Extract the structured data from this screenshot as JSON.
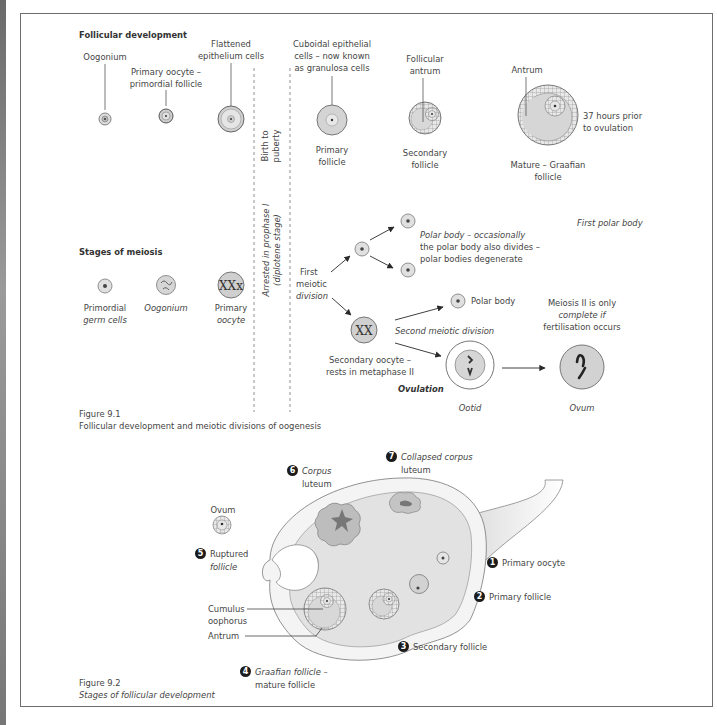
{
  "figure_9_1": {
    "caption_number": "Figure 9.1",
    "caption_text": "Follicular development and meiotic divisions of oogenesis",
    "follicular_development": {
      "heading": "Follicular development",
      "labels": {
        "oogonium": "Oogonium",
        "primary_oocyte_line1": "Primary oocyte –",
        "primary_oocyte_line2": "primordial follicle",
        "flattened_line1": "Flattened",
        "flattened_line2": "epithelium cells",
        "cuboidal_line1": "Cuboidal epithelial",
        "cuboidal_line2": "cells – now known",
        "cuboidal_line3": "as granulosa cells",
        "primary_follicle_line1": "Primary",
        "primary_follicle_line2": "follicle",
        "follicular_antrum_line1": "Follicular",
        "follicular_antrum_line2": "antrum",
        "secondary_follicle_line1": "Secondary",
        "secondary_follicle_line2": "follicle",
        "antrum": "Antrum",
        "graafian_line1": "Mature – Graafian",
        "graafian_line2": "follicle",
        "hours_line1": "37 hours prior",
        "hours_line2": "to ovulation"
      }
    },
    "dividers": {
      "birth_line1": "Birth to",
      "birth_line2": "puberty",
      "arrested_line1": "Arrested in prophase I",
      "arrested_line2": "(diplotene stage)"
    },
    "stages_of_meiosis": {
      "heading": "Stages of meiosis",
      "labels": {
        "primordial_line1": "Primordial",
        "primordial_line2": "germ cells",
        "oogonium": "Oogonium",
        "primary_oocyte_line1": "Primary",
        "primary_oocyte_line2": "oocyte",
        "first_meiotic_line1": "First",
        "first_meiotic_line2": "meiotic",
        "first_meiotic_line3": "division",
        "polar_body_note_line1": "Polar body – occasionally",
        "polar_body_note_line2": "the polar body also divides –",
        "polar_body_note_line3": "polar bodies degenerate",
        "first_polar_body": "First polar body",
        "polar_body": "Polar body",
        "second_meiotic": "Second meiotic division",
        "secondary_oocyte_line1": "Secondary oocyte –",
        "secondary_oocyte_line2": "rests in metaphase II",
        "ovulation": "Ovulation",
        "ootid": "Ootid",
        "meiosis2_line1": "Meiosis II is only",
        "meiosis2_line2": "complete if",
        "meiosis2_line3": "fertilisation occurs",
        "ovum": "Ovum"
      }
    }
  },
  "figure_9_2": {
    "caption_number": "Figure 9.2",
    "caption_text": "Stages of follicular development",
    "stages": [
      {
        "number": "1",
        "label_line1": "Primary oocyte",
        "label_line2": ""
      },
      {
        "number": "2",
        "label_line1": "Primary follicle",
        "label_line2": ""
      },
      {
        "number": "3",
        "label_line1": "Secondary follicle",
        "label_line2": ""
      },
      {
        "number": "4",
        "label_line1": "Graafian follicle –",
        "label_line2": "mature follicle"
      },
      {
        "number": "5",
        "label_line1": "Ruptured",
        "label_line2": "follicle"
      },
      {
        "number": "6",
        "label_line1": "Corpus",
        "label_line2": "luteum"
      },
      {
        "number": "7",
        "label_line1": "Collapsed corpus",
        "label_line2": "luteum"
      }
    ],
    "labels": {
      "ovum": "Ovum",
      "cumulus_line1": "Cumulus",
      "cumulus_line2": "oophorus",
      "antrum": "Antrum"
    }
  },
  "colors": {
    "cell_fill": "#d9d9d9",
    "ovary_fill": "#e6e6e6",
    "line": "#555555",
    "badge": "#1c1c1c"
  }
}
